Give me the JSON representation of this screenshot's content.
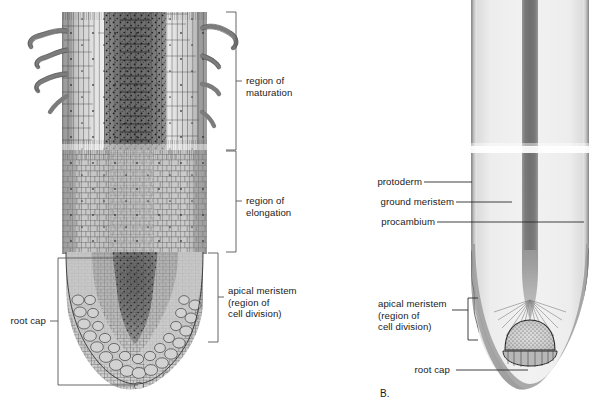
{
  "figure": {
    "panels": [
      {
        "id": "A",
        "tag": "",
        "caption": "cellular detail of root tip"
      },
      {
        "id": "B",
        "tag": "B.",
        "caption": "primary meristem tissue regions"
      }
    ]
  },
  "panel_a": {
    "labels": [
      {
        "key": "maturation",
        "text": "region of\nmaturation"
      },
      {
        "key": "elongation",
        "text": "region of\nelongation"
      },
      {
        "key": "apical_meristem",
        "text": "apical meristem\n(region of\ncell division)"
      },
      {
        "key": "root_cap",
        "text": "root cap"
      }
    ],
    "zones": [
      {
        "name": "region of maturation",
        "y_top": 12,
        "y_bottom": 150
      },
      {
        "name": "region of elongation",
        "y_top": 150,
        "y_bottom": 252
      },
      {
        "name": "apical meristem (region of cell division)",
        "y_top": 252,
        "y_bottom": 342
      },
      {
        "name": "root cap",
        "y_top": 258,
        "y_bottom": 385
      }
    ]
  },
  "panel_b": {
    "tag": "B.",
    "labels": [
      {
        "key": "protoderm",
        "text": "protoderm"
      },
      {
        "key": "ground_meristem",
        "text": "ground meristem"
      },
      {
        "key": "procambium",
        "text": "procambium"
      },
      {
        "key": "apical_meristem",
        "text": "apical meristem\n(region of\ncell division)"
      },
      {
        "key": "root_cap",
        "text": "root cap"
      }
    ]
  },
  "colors": {
    "ink": "#1a1a1a",
    "leader": "#2b2b2b",
    "bracket": "#555555",
    "background": "#ffffff",
    "protoderm": "#bdbdbd",
    "ground_meristem": "#ececec",
    "procambium": "#7a7a7a",
    "procambium_light": "#9a9a9a",
    "root_cap": "#a8a8a8",
    "root_cap_edge": "#6a6a6a",
    "quiescent_center": "#cfcfcf",
    "cell_wall": "#3a3a3a",
    "cell_fill_light": "#dcdcdc",
    "cell_fill_mid": "#b4b4b4",
    "cell_fill_dark": "#8a8a8a",
    "vascular_core": "#6f6f6f",
    "root_hair": "#8d8d8d"
  }
}
